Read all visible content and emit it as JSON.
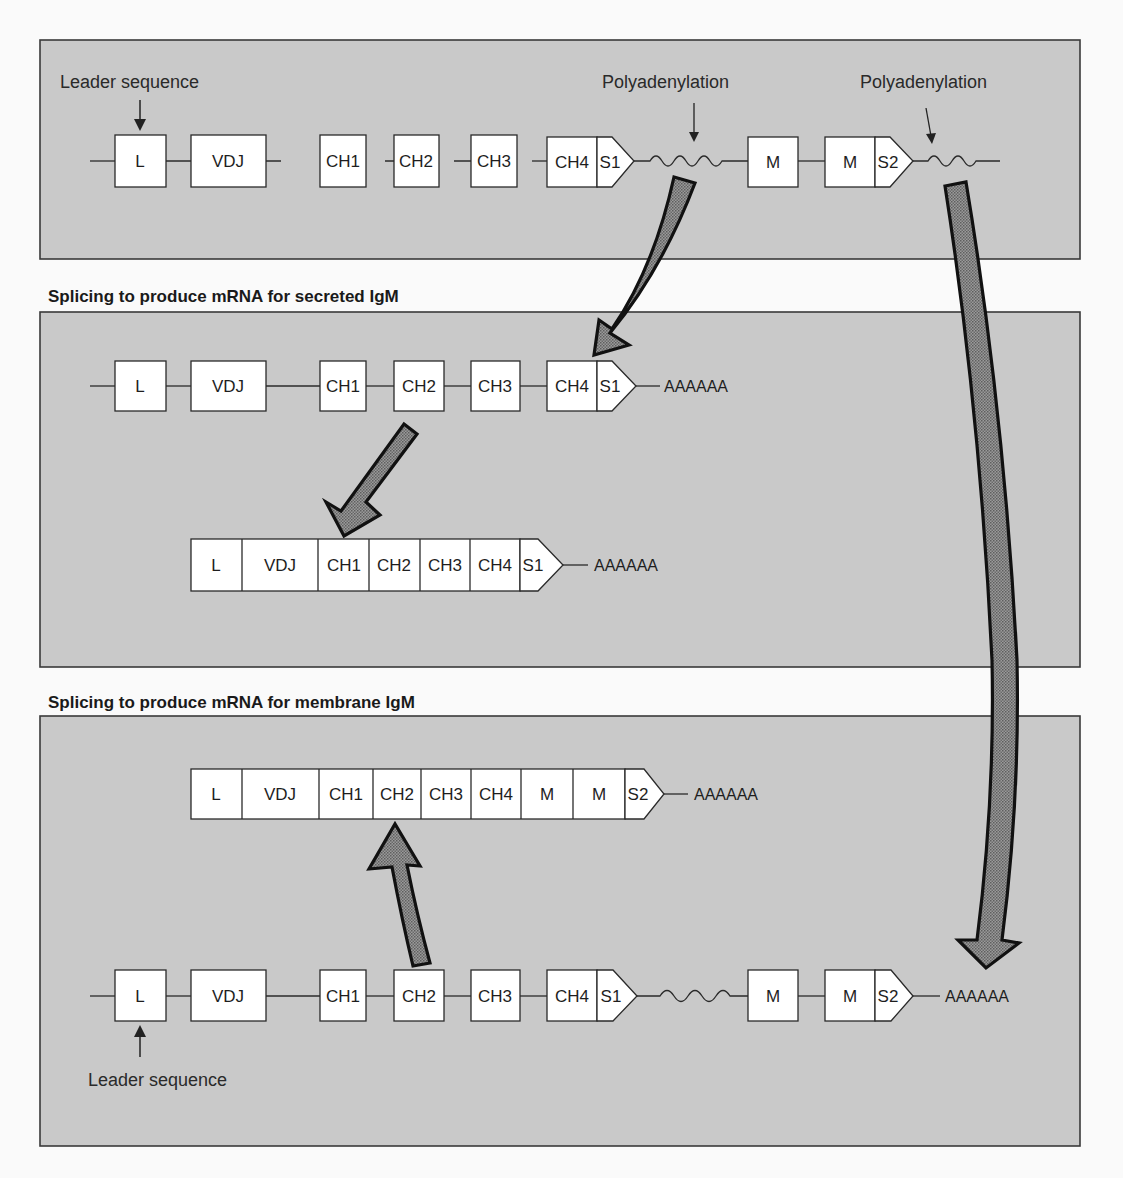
{
  "diagram": {
    "colors": {
      "panel_fill": "#c9c9c9",
      "panel_border": "#3a3a3a",
      "segment_fill": "#ffffff",
      "arrow_fill": "#8a8a8a",
      "arrow_outline": "#111111",
      "page_background": "#fafafa"
    },
    "panel1": {
      "label_leader": "Leader sequence",
      "label_poly_1": "Polyadenylation",
      "label_poly_2": "Polyadenylation",
      "segments": [
        "L",
        "VDJ",
        "CH1",
        "CH2",
        "CH3",
        "CH4",
        "S1",
        "M",
        "M",
        "S2"
      ]
    },
    "heading_secreted": "Splicing to produce mRNA for secreted  IgM",
    "panel2": {
      "top_row": {
        "segments": [
          "L",
          "VDJ",
          "CH1",
          "CH2",
          "CH3",
          "CH4",
          "S1"
        ],
        "tail": "AAAAAA"
      },
      "spliced_row": {
        "segments": [
          "L",
          "VDJ",
          "CH1",
          "CH2",
          "CH3",
          "CH4",
          "S1"
        ],
        "tail": "AAAAAA"
      }
    },
    "heading_membrane": "Splicing to produce mRNA for membrane  IgM",
    "panel3": {
      "spliced_row": {
        "segments": [
          "L",
          "VDJ",
          "CH1",
          "CH2",
          "CH3",
          "CH4",
          "M",
          "M",
          "S2"
        ],
        "tail": "AAAAAA"
      },
      "bottom_row": {
        "segments": [
          "L",
          "VDJ",
          "CH1",
          "CH2",
          "CH3",
          "CH4",
          "S1",
          "M",
          "M",
          "S2"
        ],
        "tail": "AAAAAA"
      },
      "label_leader": "Leader sequence"
    }
  }
}
